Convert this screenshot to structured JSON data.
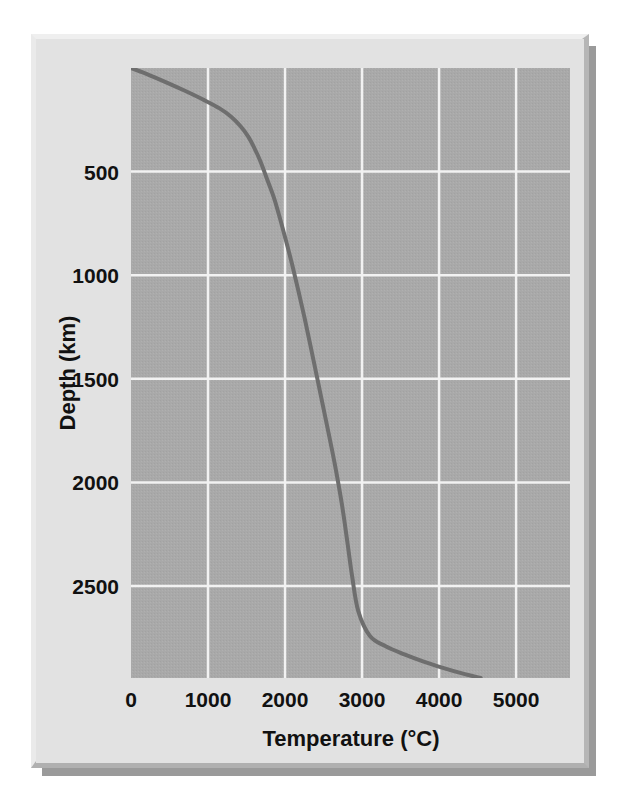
{
  "figure": {
    "name": "geothermal-gradient-figure",
    "panel_background": "#e2e2e2",
    "frame_highlight": "#efefef",
    "frame_shadow": "#b0b0b0"
  },
  "chart_data": {
    "type": "line",
    "title": "",
    "subtitle": "",
    "xlabel": "Temperature (°C)",
    "ylabel": "Depth (km)",
    "xlim": [
      0,
      5700
    ],
    "ylim": [
      0,
      2944
    ],
    "y_inverted": true,
    "grid": true,
    "grid_color": "#f2f2f2",
    "plot_fill": "#a9a9a9",
    "legend": null,
    "legend_position": "none",
    "xticks": [
      0,
      1000,
      2000,
      3000,
      4000,
      5000
    ],
    "xtick_labels": [
      "0",
      "1000",
      "2000",
      "3000",
      "4000",
      "5000"
    ],
    "yticks": [
      500,
      1000,
      1500,
      2000,
      2500
    ],
    "ytick_labels": [
      "500",
      "1000",
      "1500",
      "2000",
      "2500"
    ],
    "series": [
      {
        "name": "Geotherm",
        "color": "#6e6e6e",
        "line_width": 4,
        "x": [
          0,
          200,
          450,
          700,
          950,
          1150,
          1300,
          1420,
          1520,
          1600,
          1680,
          1760,
          1850,
          1930,
          2010,
          2090,
          2170,
          2250,
          2330,
          2420,
          2520,
          2640,
          2740,
          2810,
          2870,
          2950,
          3100,
          3300,
          3550,
          3800,
          4050,
          4300,
          4540
        ],
        "y": [
          0,
          28,
          68,
          110,
          155,
          195,
          235,
          280,
          330,
          385,
          450,
          530,
          620,
          720,
          830,
          945,
          1070,
          1200,
          1340,
          1500,
          1680,
          1900,
          2110,
          2290,
          2450,
          2620,
          2740,
          2790,
          2830,
          2865,
          2895,
          2922,
          2944
        ]
      }
    ]
  },
  "axes": {
    "x_axis_title": "Temperature (°C)",
    "y_axis_title": "Depth (km)"
  }
}
